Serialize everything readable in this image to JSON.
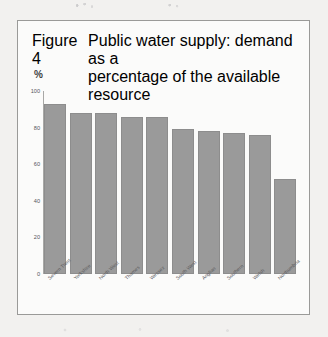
{
  "figure": {
    "number": "Figure 4",
    "caption_line1": "Public water supply: demand as a",
    "caption_line2": "percentage of the available resource",
    "caption_full": "Public water supply: demand as a percentage of the available resource"
  },
  "chart_data": {
    "type": "bar",
    "title": "Figure 4  Public water supply: demand as a percentage of the available resource",
    "xlabel": "",
    "ylabel": "%",
    "ylim": [
      0,
      100
    ],
    "yticks": [
      0,
      20,
      40,
      60,
      80,
      100
    ],
    "ytick_labels": [
      "0",
      "20",
      "40",
      "60",
      "80",
      "100"
    ],
    "grid": false,
    "legend": "none",
    "bar_color": "#9a9a9a",
    "categories": [
      "Severn Trent",
      "Yorkshire",
      "North West",
      "Thames",
      "Wessex",
      "South West",
      "Anglian",
      "Southern",
      "Welsh",
      "Northumbria"
    ],
    "values": [
      93,
      88,
      88,
      86,
      86,
      79,
      78,
      77,
      76,
      52
    ]
  }
}
